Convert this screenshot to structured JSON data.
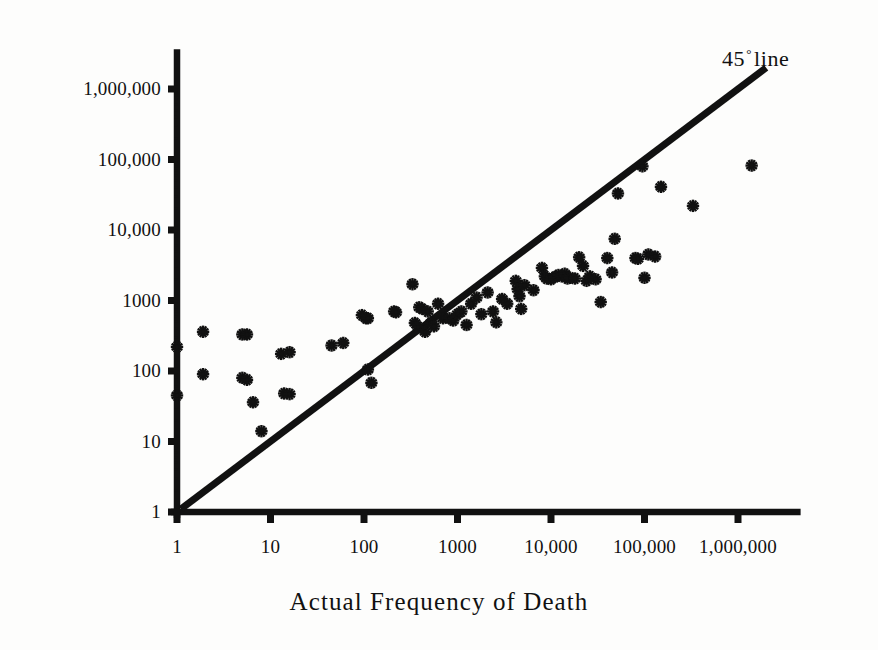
{
  "figure": {
    "background_color": "#fdfdfc",
    "ink_color": "#111111"
  },
  "annotations": {
    "line_label_prefix": "45",
    "line_label_degree": "°",
    "line_label_suffix": "line"
  },
  "chart_data": {
    "type": "scatter",
    "title": "",
    "subtitle": "",
    "xlabel": "Actual Frequency of Death",
    "ylabel": "",
    "xscale": "log",
    "yscale": "log",
    "xlim": [
      1,
      3000000
    ],
    "ylim": [
      1,
      3000000
    ],
    "grid": false,
    "legend": "none",
    "marker": "asterisk",
    "marker_color": "#111111",
    "xticks": [
      1,
      10,
      100,
      1000,
      10000,
      100000,
      1000000
    ],
    "xtick_labels": [
      "1",
      "10",
      "100",
      "1000",
      "10,000",
      "100,000",
      "1,000,000"
    ],
    "yticks": [
      1,
      10,
      100,
      1000,
      10000,
      100000,
      1000000
    ],
    "ytick_labels": [
      "1",
      "10",
      "100",
      "1000",
      "10,000",
      "100,000",
      "1,000,000"
    ],
    "reference_line": {
      "name": "45 degree line",
      "label": "45° line",
      "slope": 1,
      "intercept": 0,
      "x_start": 1.1,
      "y_start": 1.1,
      "x_end": 2000000,
      "y_end": 2000000,
      "color": "#111111",
      "width_px": 7
    },
    "series": [
      {
        "name": "Perceived vs actual frequency of death",
        "points": [
          [
            1,
            220
          ],
          [
            1,
            45
          ],
          [
            1.9,
            360
          ],
          [
            1.9,
            90
          ],
          [
            5,
            330
          ],
          [
            5.6,
            330
          ],
          [
            5,
            80
          ],
          [
            5.6,
            75
          ],
          [
            6.5,
            36
          ],
          [
            8,
            14
          ],
          [
            13,
            175
          ],
          [
            16,
            185
          ],
          [
            14,
            48
          ],
          [
            16,
            47
          ],
          [
            45,
            230
          ],
          [
            60,
            250
          ],
          [
            95,
            620
          ],
          [
            105,
            560
          ],
          [
            110,
            560
          ],
          [
            110,
            105
          ],
          [
            120,
            68
          ],
          [
            210,
            700
          ],
          [
            220,
            680
          ],
          [
            330,
            1700
          ],
          [
            350,
            480
          ],
          [
            380,
            420
          ],
          [
            390,
            800
          ],
          [
            420,
            760
          ],
          [
            450,
            360
          ],
          [
            480,
            700
          ],
          [
            520,
            480
          ],
          [
            560,
            430
          ],
          [
            620,
            900
          ],
          [
            700,
            560
          ],
          [
            820,
            560
          ],
          [
            900,
            520
          ],
          [
            1000,
            640
          ],
          [
            1100,
            700
          ],
          [
            1250,
            450
          ],
          [
            1400,
            900
          ],
          [
            1600,
            1100
          ],
          [
            1800,
            640
          ],
          [
            2100,
            1300
          ],
          [
            2400,
            700
          ],
          [
            2600,
            490
          ],
          [
            3000,
            1050
          ],
          [
            3400,
            900
          ],
          [
            4200,
            1900
          ],
          [
            4400,
            1450
          ],
          [
            4600,
            1150
          ],
          [
            4800,
            760
          ],
          [
            5200,
            1650
          ],
          [
            6500,
            1400
          ],
          [
            8000,
            2900
          ],
          [
            8600,
            2200
          ],
          [
            9000,
            2050
          ],
          [
            10000,
            2000
          ],
          [
            11000,
            2150
          ],
          [
            12000,
            2300
          ],
          [
            13000,
            2200
          ],
          [
            14000,
            2400
          ],
          [
            15000,
            2050
          ],
          [
            16000,
            2100
          ],
          [
            18000,
            2050
          ],
          [
            20000,
            4100
          ],
          [
            22000,
            3100
          ],
          [
            24000,
            1900
          ],
          [
            26000,
            2200
          ],
          [
            30000,
            2000
          ],
          [
            34000,
            950
          ],
          [
            40000,
            4000
          ],
          [
            45000,
            2500
          ],
          [
            48000,
            7500
          ],
          [
            52000,
            33000
          ],
          [
            80000,
            4000
          ],
          [
            85000,
            3900
          ],
          [
            95000,
            80000
          ],
          [
            100000,
            2100
          ],
          [
            110000,
            4500
          ],
          [
            130000,
            4200
          ],
          [
            150000,
            41000
          ],
          [
            330000,
            22000
          ],
          [
            1400000,
            82000
          ]
        ]
      }
    ]
  },
  "axis_geometry": {
    "x_origin_px": 177,
    "y_origin_px": 512,
    "decade_x_px": 93.5,
    "decade_y_px": 70.5
  }
}
